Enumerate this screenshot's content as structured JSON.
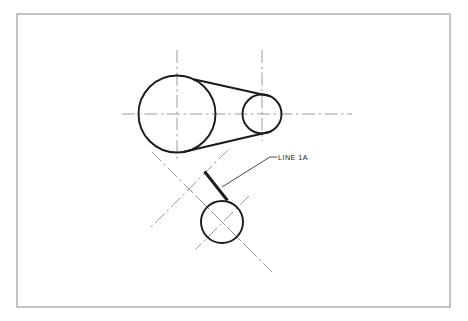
{
  "drawing": {
    "title": "Pulley and belt drive construction layout",
    "background_color": "#ffffff",
    "line_color": "#1b1b1b",
    "centerline_color": "#8a8a8a",
    "border_color": "#9a9a9a",
    "border": {
      "x": 17,
      "y": 14,
      "width": 433,
      "height": 293,
      "stroke_width": 1.2
    },
    "annotations": [
      {
        "id": "line-1a",
        "label": "LINE  1A",
        "text_x": 278,
        "text_y": 160,
        "leader": "M 222 187 L 270 157 L 277 157"
      }
    ],
    "circles": [
      {
        "id": "large-pulley",
        "cx": 177,
        "cy": 114,
        "r": 38.5,
        "stroke_width": 1.9
      },
      {
        "id": "small-pulley",
        "cx": 262,
        "cy": 114,
        "r": 19.5,
        "stroke_width": 1.9
      },
      {
        "id": "lower-pulley",
        "cx": 222,
        "cy": 222,
        "r": 21,
        "stroke_width": 1.9
      }
    ],
    "belt_tangents": [
      {
        "id": "belt-upper-tangent",
        "x1": 193.5,
        "y1": 79.2,
        "x2": 270.5,
        "y2": 96.2,
        "stroke_width": 1.9
      },
      {
        "id": "belt-lower-tangent",
        "x1": 182.0,
        "y1": 152.2,
        "x2": 271.0,
        "y2": 131.5,
        "stroke_width": 1.9
      }
    ],
    "thick_segments": [
      {
        "id": "line-1a-segment",
        "x1": 204.5,
        "y1": 171.5,
        "x2": 227.5,
        "y2": 200.5,
        "stroke_width": 2.9
      }
    ],
    "centerlines": [
      {
        "id": "main-horizontal-centerline",
        "x1": 122,
        "y1": 114,
        "x2": 352,
        "y2": 114
      },
      {
        "id": "large-pulley-vertical-centerline",
        "x1": 177,
        "y1": 50,
        "x2": 177,
        "y2": 161
      },
      {
        "id": "small-pulley-vertical-centerline",
        "x1": 262,
        "y1": 50,
        "x2": 262,
        "y2": 141
      },
      {
        "id": "construction-diagonal-down-right",
        "x1": 152,
        "y1": 152,
        "x2": 272,
        "y2": 272
      },
      {
        "id": "construction-diagonal-down-left",
        "x1": 228,
        "y1": 150,
        "x2": 150,
        "y2": 228
      },
      {
        "id": "lower-pulley-diagonal-centerline-a",
        "x1": 196,
        "y1": 196,
        "x2": 249,
        "y2": 249
      },
      {
        "id": "lower-pulley-diagonal-centerline-b",
        "x1": 249,
        "y1": 196,
        "x2": 196,
        "y2": 249
      }
    ]
  }
}
